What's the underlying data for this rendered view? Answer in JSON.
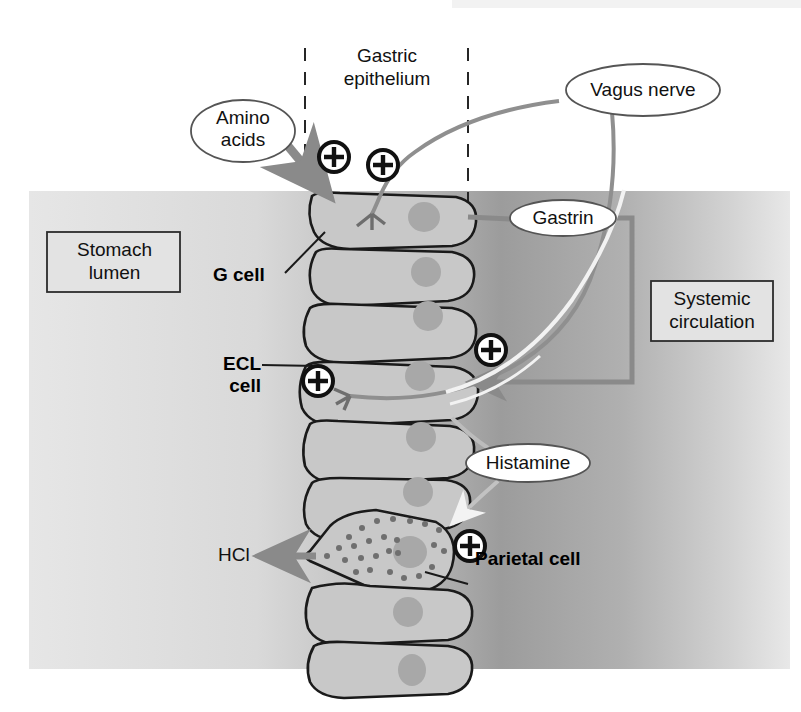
{
  "figure": {
    "type": "biological-schematic"
  },
  "labels": {
    "gastric_epithelium": "Gastric\nepithelium",
    "gastric_epithelium_line1": "Gastric",
    "gastric_epithelium_line2": "epithelium",
    "amino_acids": "Amino\nacids",
    "amino_acids_line1": "Amino",
    "amino_acids_line2": "acids",
    "vagus_nerve": "Vagus nerve",
    "gastrin": "Gastrin",
    "histamine": "Histamine",
    "stomach_lumen_line1": "Stomach",
    "stomach_lumen_line2": "lumen",
    "systemic_circulation_line1": "Systemic",
    "systemic_circulation_line2": "circulation",
    "g_cell": "G cell",
    "ecl_cell_line1": "ECL",
    "ecl_cell_line2": "cell",
    "parietal_cell": "Parietal cell",
    "hcl": "HCl",
    "plus_sign": "+"
  },
  "plus_markers": [
    {
      "name": "plus-amino-acids",
      "x": 334,
      "y": 157
    },
    {
      "name": "plus-vagus-gcell",
      "x": 383,
      "y": 165
    },
    {
      "name": "plus-gastrin-ecl",
      "x": 491,
      "y": 350
    },
    {
      "name": "plus-vagus-ecl",
      "x": 318,
      "y": 381
    },
    {
      "name": "plus-histamine-parietal",
      "x": 470,
      "y": 546
    }
  ],
  "cells": [
    {
      "name": "g-cell",
      "kind": "G cell",
      "nucleus": true
    },
    {
      "name": "epithelial-cell-2",
      "kind": "epithelial",
      "nucleus": true
    },
    {
      "name": "epithelial-cell-3",
      "kind": "epithelial",
      "nucleus": true
    },
    {
      "name": "ecl-cell",
      "kind": "ECL cell",
      "nucleus": true
    },
    {
      "name": "epithelial-cell-5",
      "kind": "epithelial",
      "nucleus": true
    },
    {
      "name": "epithelial-cell-6",
      "kind": "epithelial",
      "nucleus": true
    },
    {
      "name": "parietal-cell",
      "kind": "Parietal cell",
      "nucleus": true,
      "granules": true
    },
    {
      "name": "epithelial-cell-8",
      "kind": "epithelial",
      "nucleus": true
    },
    {
      "name": "epithelial-cell-9",
      "kind": "epithelial",
      "nucleus": true
    }
  ],
  "colors": {
    "cell_fill": "#c8c8c8",
    "cell_stroke": "#1a1a1a",
    "nucleus_fill": "#a8a8a8",
    "arrow_gray": "#8a8a8a",
    "nerve_gray": "#8f8f8f",
    "band_left": "#dcdcdc",
    "band_right": "#a6a6a6",
    "box_fill": "#e3e3e3",
    "box_stroke": "#2c2c2c",
    "text": "#111111",
    "white": "#ffffff"
  },
  "pathways": [
    {
      "name": "amino-acids-to-gcell",
      "from": "Amino acids",
      "to": "G cell",
      "effect": "+"
    },
    {
      "name": "vagus-to-gcell",
      "from": "Vagus nerve",
      "to": "G cell",
      "effect": "+"
    },
    {
      "name": "gcell-to-gastrin",
      "from": "G cell",
      "to": "Gastrin",
      "effect": "secretion"
    },
    {
      "name": "gastrin-systemic-to-ecl",
      "from": "Gastrin (systemic circulation)",
      "to": "ECL cell",
      "effect": "+"
    },
    {
      "name": "vagus-to-ecl",
      "from": "Vagus nerve",
      "to": "ECL cell",
      "effect": "+"
    },
    {
      "name": "ecl-to-histamine",
      "from": "ECL cell",
      "to": "Histamine",
      "effect": "secretion"
    },
    {
      "name": "histamine-to-parietal",
      "from": "Histamine",
      "to": "Parietal cell",
      "effect": "+"
    },
    {
      "name": "parietal-to-hcl",
      "from": "Parietal cell",
      "to": "HCl",
      "effect": "secretion"
    }
  ]
}
